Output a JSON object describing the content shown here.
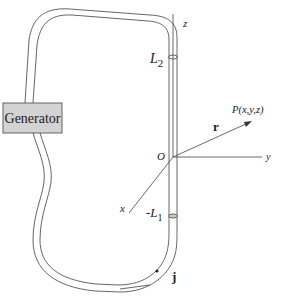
{
  "diagram": {
    "generator": {
      "label": "Generator",
      "fill": "#d3d3d3",
      "stroke": "#555555"
    },
    "axes": {
      "z_label": "z",
      "y_label": "y",
      "x_label": "x",
      "origin_label": "O"
    },
    "antenna": {
      "top_label_base": "L",
      "top_label_sub": "2",
      "bottom_label_base": "-L",
      "bottom_label_sub": "1"
    },
    "vector": {
      "label": "r",
      "point_label": "P(x,y,z)"
    },
    "current": {
      "label": "j"
    },
    "colors": {
      "wire": "#555555",
      "axis": "#444444",
      "text": "#222222"
    }
  }
}
